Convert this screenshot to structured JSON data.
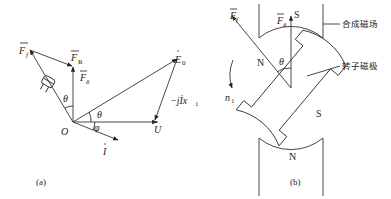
{
  "figure_a": {
    "caption": "(a)",
    "labels": {
      "Ff": "F",
      "Ff_sub": "f",
      "FR": "F",
      "FR_sub": "R",
      "Fdelta": "F",
      "Fdelta_sub": "δ",
      "E0": "E",
      "E0_sub": "0",
      "jIx": "−jİx",
      "jIx_sub": "1",
      "U": "U",
      "I": "I",
      "O": "O",
      "theta1": "θ",
      "theta2": "θ",
      "phi": "φ"
    }
  },
  "figure_b": {
    "caption": "(b)",
    "labels": {
      "Ff": "F",
      "Ff_sub": "f",
      "Fdelta": "F",
      "Fdelta_sub": "δ",
      "S_top": "S",
      "N_bottom": "N",
      "N_rotor": "N",
      "S_rotor": "S",
      "theta": "θ",
      "n1": "n",
      "n1_sub": "1",
      "combined_field": "合成磁场",
      "rotor_pole": "转子磁极"
    }
  }
}
